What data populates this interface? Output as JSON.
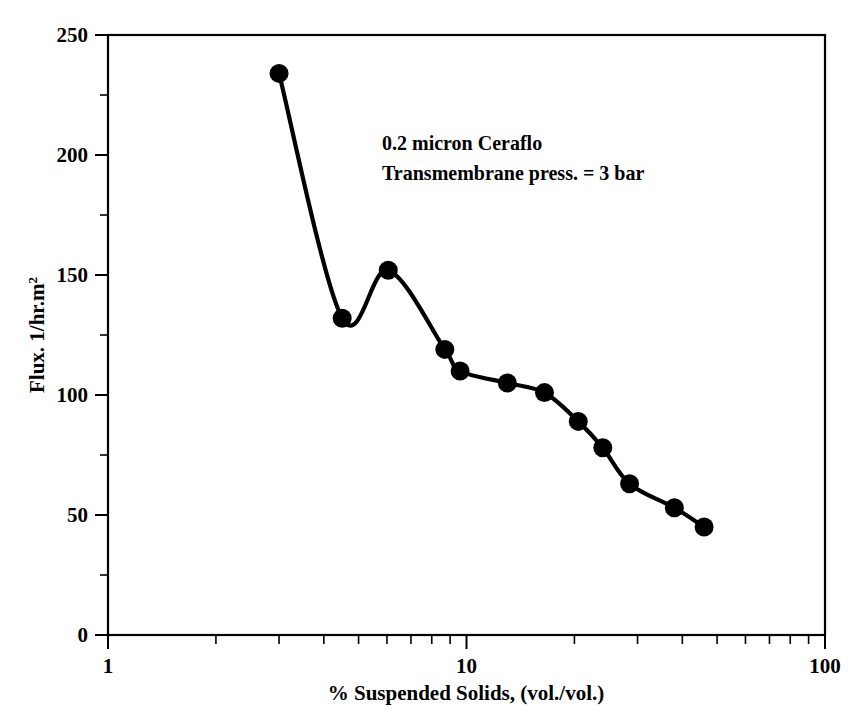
{
  "figure": {
    "background_color": "#ffffff",
    "ink_color": "#000000"
  },
  "annotation": {
    "line1": "0.2 micron Ceraflo",
    "line2": "Transmembrane press. = 3 bar"
  },
  "axes": {
    "x_title": "% Suspended Solids, (vol./vol.)",
    "y_title_main": "Flux. 1/hr.m",
    "y_title_superscript": "2",
    "x_tick_labels": [
      "1",
      "10",
      "100"
    ],
    "y_tick_labels": [
      "0",
      "50",
      "100",
      "150",
      "200",
      "250"
    ]
  },
  "chart_data": {
    "type": "line",
    "title": "",
    "xlabel": "% Suspended Solids, (vol./vol.)",
    "ylabel": "Flux. 1/hr.m2",
    "xscale": "log",
    "yscale": "linear",
    "xlim": [
      1,
      100
    ],
    "ylim": [
      0,
      250
    ],
    "x_major_ticks": [
      1,
      10,
      100
    ],
    "x_minor_ticks": [
      2,
      3,
      4,
      5,
      6,
      7,
      8,
      9,
      20,
      30,
      40,
      50,
      60,
      70,
      80,
      90
    ],
    "y_major_ticks": [
      0,
      50,
      100,
      150,
      200,
      250
    ],
    "y_minor_ticks": [
      25,
      75,
      125,
      175,
      225
    ],
    "grid": false,
    "legend": null,
    "marker": "filled-circle",
    "annotations": [
      "0.2 micron Ceraflo",
      "Transmembrane press. = 3 bar"
    ],
    "series": [
      {
        "name": "0.2 micron Ceraflo, 3 bar",
        "x": [
          3.0,
          4.5,
          6.05,
          8.7,
          9.6,
          13.0,
          16.5,
          20.5,
          24.0,
          28.5,
          38.0,
          46.0
        ],
        "y": [
          234,
          132,
          152,
          119,
          110,
          105,
          101,
          89,
          78,
          63,
          53,
          45
        ]
      }
    ]
  }
}
